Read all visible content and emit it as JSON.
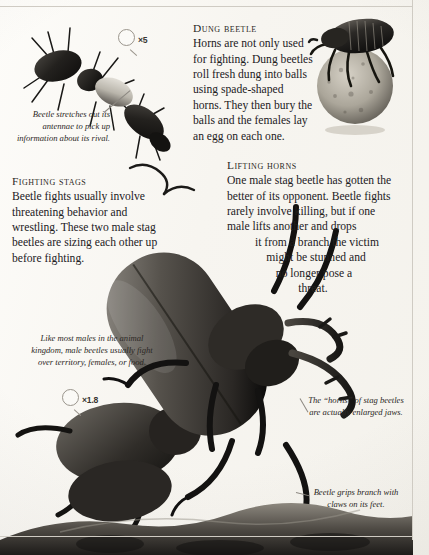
{
  "page": {
    "background_color": "#fbfaf7",
    "rule_color": "#cfcbc3",
    "ink_color": "#23211e"
  },
  "sections": {
    "dung_beetle": {
      "heading": "Dung beetle",
      "body": "Horns are not only used for fighting. Dung beetles roll fresh dung into balls using spade-shaped horns. They then bury the balls and the females lay an egg on each one."
    },
    "lifting_horns": {
      "heading": "Lifting horns",
      "body_lines": [
        "One male stag beetle has gotten",
        "the better of its opponent. Beetle",
        "fights rarely involve killing, but if",
        "one male lifts another and drops",
        "it from a branch the victim",
        "might be stunned and",
        "no longer pose a",
        "threat."
      ]
    },
    "fighting_stags": {
      "heading": "Fighting stags",
      "body": "Beetle fights usually involve threatening behavior and wrestling. These two male stag beetles are sizing each other up before fighting."
    }
  },
  "captions": {
    "antennae": "Beetle stretches out its antennae to pick up information about its rival.",
    "males_fight": "Like most males in the animal kingdom, male beetles usually fight over territory, females, or food.",
    "jaws": "The “horns” of stag beetles are actually enlarged jaws.",
    "claws": "Beetle grips branch with claws on its feet."
  },
  "scale_markers": {
    "rove_beetle": {
      "icon": "magnifier-icon",
      "value": "×5"
    },
    "stag_beetle": {
      "icon": "magnifier-icon",
      "value": "×1.8"
    }
  },
  "illustrations": {
    "rove_beetle": "rove-beetle-photo",
    "dung_beetle_with_ball": "dung-beetle-photo",
    "fighting_stag_beetles": "stag-beetles-photo",
    "branch_ground": "branch-ground-photo"
  }
}
